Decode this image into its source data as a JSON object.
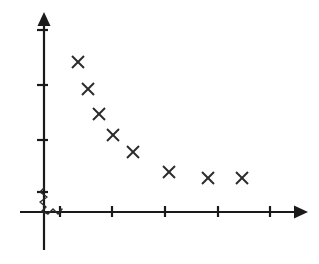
{
  "chart_data": {
    "type": "scatter",
    "title": "",
    "xlabel": "",
    "ylabel": "",
    "grid": false,
    "legend": false,
    "marker": "x",
    "marker_color": "#2b2b2b",
    "axis_color": "#1a1a1a",
    "background_color": "#ffffff",
    "axis_break": true,
    "axis_break_note": "zigzag break symbol at origin on both axes",
    "x": [
      1,
      1.4,
      1.6,
      1.9,
      2.3,
      3.0,
      3.7,
      4.4
    ],
    "y": [
      7.6,
      6.8,
      6.2,
      5.4,
      4.8,
      3.9,
      3.6,
      3.6
    ],
    "xlim": [
      0,
      5.5
    ],
    "ylim": [
      0,
      9
    ],
    "xticks": [
      1,
      2,
      3,
      4,
      5
    ],
    "yticks": [
      2,
      4,
      6,
      8
    ],
    "xtick_labels": [
      "",
      "",
      "",
      "",
      ""
    ],
    "ytick_labels": [
      "",
      "",
      "",
      ""
    ],
    "points": [
      {
        "px": 78,
        "py": 62
      },
      {
        "px": 88,
        "py": 89
      },
      {
        "px": 99,
        "py": 114
      },
      {
        "px": 113,
        "py": 135
      },
      {
        "px": 133,
        "py": 152
      },
      {
        "px": 169,
        "py": 172
      },
      {
        "px": 208,
        "py": 178
      },
      {
        "px": 242,
        "py": 178
      }
    ],
    "marker_half_size": 6,
    "axes_pixels": {
      "y_axis_x": 44,
      "x_axis_y": 212,
      "y_axis_top": 18,
      "y_axis_bottom": 250,
      "x_axis_left": 20,
      "x_axis_right": 300
    },
    "xtick_pixels": [
      60,
      112,
      165,
      218,
      270
    ],
    "ytick_pixels": [
      30,
      85,
      140,
      192
    ]
  }
}
